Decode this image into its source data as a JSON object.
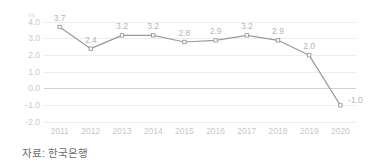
{
  "chart_data": {
    "type": "line",
    "title": "",
    "xlabel": "",
    "ylabel": "%",
    "unit_label": "%",
    "categories": [
      "2011",
      "2012",
      "2013",
      "2014",
      "2015",
      "2016",
      "2017",
      "2018",
      "2019",
      "2020"
    ],
    "values": [
      3.7,
      2.4,
      3.2,
      3.2,
      2.8,
      2.9,
      3.2,
      2.9,
      2.0,
      -1.0
    ],
    "point_labels": [
      "3.7",
      "2.4",
      "3.2",
      "3.2",
      "2.8",
      "2.9",
      "3.2",
      "2.9",
      "2.0",
      "-1.0"
    ],
    "ylim": [
      -2.0,
      4.0
    ],
    "yticks": [
      4.0,
      3.0,
      2.0,
      1.0,
      0.0,
      -1.0,
      -2.0
    ],
    "ytick_labels": [
      "4.0",
      "3.0",
      "2.0",
      "1.0",
      "0.0",
      "-1.0",
      "-2.0"
    ],
    "grid": true,
    "legend": "none",
    "series_name": "",
    "colors": {
      "line": "#9a9a9a",
      "marker_fill": "#ffffff",
      "marker_stroke": "#9a9a9a",
      "grid": "#ededed",
      "zero_line": "#d2d2d2",
      "tick_text": "#c9c9c9",
      "point_label_text": "#b5b5b5",
      "caption_text": "#6b6b6b"
    }
  },
  "caption": {
    "source_text": "자료: 한국은행"
  }
}
